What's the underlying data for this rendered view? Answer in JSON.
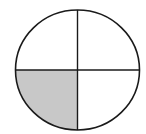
{
  "diagram": {
    "type": "fraction-circle",
    "parts_total": 4,
    "parts_shaded": 1,
    "shaded_quadrant": "bottom-left",
    "fraction": "1/4",
    "colors": {
      "stroke": "#1a1a1a",
      "shade": "#c8c8c8",
      "background": "#ffffff"
    }
  },
  "caption": {
    "clipped_text": ""
  }
}
